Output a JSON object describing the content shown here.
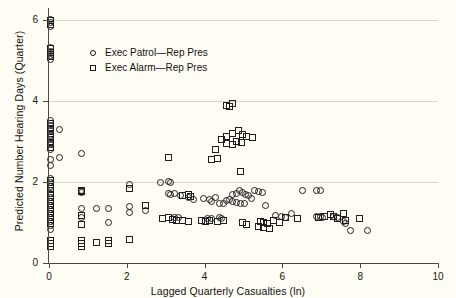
{
  "chart_data": {
    "type": "scatter",
    "title": "",
    "xlabel": "Lagged Quarterly Casualties (ln)",
    "ylabel": "Predicted Number Hearing Days (Quarter)",
    "xlim": [
      0,
      10
    ],
    "ylim": [
      0,
      6.3
    ],
    "xticks": [
      0,
      2,
      4,
      6,
      8,
      10
    ],
    "xticklabels": [
      "0",
      "2",
      "4",
      "6",
      "8",
      "10"
    ],
    "yticks": [
      0,
      2,
      4,
      6
    ],
    "yticklabels": [
      "0",
      "2",
      "4",
      "6"
    ],
    "grid": "horizontal",
    "gridlines_y": [
      0,
      2,
      4,
      6
    ],
    "legend_position": "upper left",
    "background_color": "#fffdf4",
    "gridline_color": "#d8d6cd",
    "axis_color": "#4a4a4a",
    "marker_color": "#1f1f1f",
    "series": [
      {
        "name": "Exec Patrol—Rep Pres",
        "marker": "circle",
        "points": [
          [
            0.02,
            6.02
          ],
          [
            0.02,
            5.93
          ],
          [
            0.02,
            5.84
          ],
          [
            0.02,
            5.32
          ],
          [
            0.02,
            5.22
          ],
          [
            0.02,
            5.12
          ],
          [
            0.02,
            5.02
          ],
          [
            0.02,
            3.52
          ],
          [
            0.02,
            3.4
          ],
          [
            0.02,
            3.28
          ],
          [
            0.02,
            3.16
          ],
          [
            0.02,
            3.04
          ],
          [
            0.02,
            2.92
          ],
          [
            0.02,
            2.8
          ],
          [
            0.02,
            2.55
          ],
          [
            0.02,
            2.42
          ],
          [
            0.02,
            2.1
          ],
          [
            0.02,
            2.0
          ],
          [
            0.02,
            1.9
          ],
          [
            0.02,
            1.72
          ],
          [
            0.02,
            1.62
          ],
          [
            0.02,
            1.52
          ],
          [
            0.02,
            1.42
          ],
          [
            0.02,
            1.32
          ],
          [
            0.02,
            1.22
          ],
          [
            0.02,
            1.12
          ],
          [
            0.02,
            1.02
          ],
          [
            0.02,
            0.92
          ],
          [
            0.02,
            0.82
          ],
          [
            0.25,
            3.3
          ],
          [
            0.25,
            2.6
          ],
          [
            0.8,
            2.7
          ],
          [
            0.8,
            1.78
          ],
          [
            0.8,
            1.74
          ],
          [
            0.8,
            1.35
          ],
          [
            0.8,
            1.12
          ],
          [
            1.2,
            1.35
          ],
          [
            1.5,
            1.35
          ],
          [
            1.5,
            1.0
          ],
          [
            2.05,
            1.95
          ],
          [
            2.05,
            1.4
          ],
          [
            2.05,
            1.25
          ],
          [
            2.45,
            1.3
          ],
          [
            2.85,
            2.0
          ],
          [
            3.05,
            2.02
          ],
          [
            3.1,
            2.0
          ],
          [
            3.05,
            1.72
          ],
          [
            3.1,
            1.7
          ],
          [
            3.2,
            1.72
          ],
          [
            3.35,
            1.68
          ],
          [
            3.55,
            1.62
          ],
          [
            3.7,
            1.58
          ],
          [
            3.2,
            1.12
          ],
          [
            3.3,
            1.12
          ],
          [
            3.95,
            1.6
          ],
          [
            4.1,
            1.58
          ],
          [
            4.15,
            1.52
          ],
          [
            4.25,
            1.62
          ],
          [
            4.35,
            1.48
          ],
          [
            4.45,
            1.46
          ],
          [
            4.55,
            1.55
          ],
          [
            4.05,
            1.1
          ],
          [
            4.15,
            1.1
          ],
          [
            4.35,
            1.12
          ],
          [
            4.42,
            1.1
          ],
          [
            4.62,
            1.58
          ],
          [
            4.7,
            1.7
          ],
          [
            4.8,
            1.72
          ],
          [
            4.88,
            1.78
          ],
          [
            4.95,
            1.74
          ],
          [
            5.02,
            1.7
          ],
          [
            5.1,
            1.66
          ],
          [
            5.18,
            1.6
          ],
          [
            4.7,
            1.52
          ],
          [
            4.8,
            1.5
          ],
          [
            4.9,
            1.48
          ],
          [
            5.0,
            1.46
          ],
          [
            5.25,
            1.8
          ],
          [
            5.35,
            1.76
          ],
          [
            5.45,
            1.74
          ],
          [
            5.55,
            1.42
          ],
          [
            5.8,
            1.18
          ],
          [
            5.95,
            1.16
          ],
          [
            6.05,
            1.12
          ],
          [
            6.2,
            1.22
          ],
          [
            6.5,
            1.8
          ],
          [
            6.85,
            1.78
          ],
          [
            6.95,
            1.78
          ],
          [
            6.85,
            1.14
          ],
          [
            6.95,
            1.14
          ],
          [
            7.0,
            1.12
          ],
          [
            7.3,
            1.14
          ],
          [
            7.4,
            1.12
          ],
          [
            7.55,
            1.02
          ],
          [
            7.6,
            0.98
          ],
          [
            7.72,
            0.8
          ],
          [
            8.15,
            0.8
          ]
        ]
      },
      {
        "name": "Exec Alarm—Rep Pres",
        "marker": "square",
        "points": [
          [
            0.02,
            6.0
          ],
          [
            0.02,
            5.9
          ],
          [
            0.02,
            5.3
          ],
          [
            0.02,
            5.2
          ],
          [
            0.02,
            5.1
          ],
          [
            0.02,
            3.45
          ],
          [
            0.02,
            3.33
          ],
          [
            0.02,
            3.21
          ],
          [
            0.02,
            3.09
          ],
          [
            0.02,
            2.97
          ],
          [
            0.02,
            2.85
          ],
          [
            0.02,
            2.05
          ],
          [
            0.02,
            1.95
          ],
          [
            0.02,
            1.85
          ],
          [
            0.02,
            1.68
          ],
          [
            0.02,
            1.58
          ],
          [
            0.02,
            1.48
          ],
          [
            0.02,
            1.38
          ],
          [
            0.02,
            1.28
          ],
          [
            0.02,
            1.18
          ],
          [
            0.02,
            1.08
          ],
          [
            0.02,
            0.98
          ],
          [
            0.02,
            0.55
          ],
          [
            0.02,
            0.48
          ],
          [
            0.02,
            0.41
          ],
          [
            0.8,
            1.8
          ],
          [
            0.8,
            1.76
          ],
          [
            0.8,
            1.18
          ],
          [
            0.8,
            0.95
          ],
          [
            0.8,
            0.55
          ],
          [
            0.8,
            0.48
          ],
          [
            0.8,
            0.41
          ],
          [
            1.2,
            0.5
          ],
          [
            1.5,
            0.55
          ],
          [
            1.5,
            0.47
          ],
          [
            2.05,
            1.85
          ],
          [
            2.05,
            0.58
          ],
          [
            2.45,
            1.42
          ],
          [
            2.9,
            1.1
          ],
          [
            3.05,
            1.12
          ],
          [
            3.15,
            1.08
          ],
          [
            3.25,
            1.06
          ],
          [
            3.4,
            1.66
          ],
          [
            3.55,
            1.7
          ],
          [
            3.6,
            1.64
          ],
          [
            3.4,
            1.05
          ],
          [
            3.55,
            1.03
          ],
          [
            3.05,
            2.6
          ],
          [
            3.9,
            1.04
          ],
          [
            4.0,
            1.02
          ],
          [
            4.1,
            1.05
          ],
          [
            4.3,
            1.02
          ],
          [
            4.45,
            1.04
          ],
          [
            4.55,
            3.88
          ],
          [
            4.62,
            3.86
          ],
          [
            4.7,
            3.95
          ],
          [
            4.4,
            3.05
          ],
          [
            4.55,
            3.12
          ],
          [
            4.7,
            3.2
          ],
          [
            4.85,
            3.28
          ],
          [
            4.95,
            3.18
          ],
          [
            5.05,
            3.12
          ],
          [
            4.55,
            2.96
          ],
          [
            4.7,
            2.94
          ],
          [
            4.8,
            3.0
          ],
          [
            4.92,
            2.98
          ],
          [
            5.2,
            3.1
          ],
          [
            4.25,
            2.8
          ],
          [
            4.15,
            2.55
          ],
          [
            4.3,
            2.58
          ],
          [
            4.9,
            2.25
          ],
          [
            5.4,
            1.02
          ],
          [
            5.5,
            1.0
          ],
          [
            5.6,
            0.98
          ],
          [
            5.75,
            1.04
          ],
          [
            5.9,
            1.0
          ],
          [
            5.35,
            0.9
          ],
          [
            5.5,
            0.88
          ],
          [
            5.65,
            0.85
          ],
          [
            4.95,
            1.0
          ],
          [
            5.05,
            0.96
          ],
          [
            6.05,
            1.12
          ],
          [
            6.35,
            1.1
          ],
          [
            6.9,
            1.12
          ],
          [
            7.05,
            1.14
          ],
          [
            7.2,
            1.2
          ],
          [
            7.3,
            1.16
          ],
          [
            7.4,
            1.1
          ],
          [
            7.55,
            1.22
          ],
          [
            7.6,
            1.04
          ],
          [
            7.95,
            1.1
          ]
        ]
      }
    ]
  },
  "axes": {
    "x_title": "Lagged Quarterly Casualties (ln)",
    "y_title": "Predicted Number Hearing Days (Quarter)",
    "x_ticks": [
      "0",
      "2",
      "4",
      "6",
      "8",
      "10"
    ],
    "y_ticks": [
      "0",
      "2",
      "4",
      "6"
    ]
  },
  "legend": {
    "entries": [
      {
        "label": "Exec Patrol—Rep Pres",
        "marker": "circle"
      },
      {
        "label": "Exec Alarm—Rep Pres",
        "marker": "square"
      }
    ]
  }
}
